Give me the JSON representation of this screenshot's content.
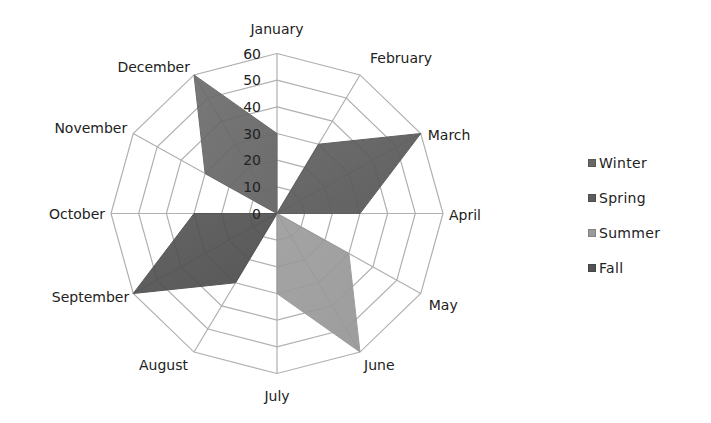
{
  "chart_data": {
    "type": "radar",
    "title": "",
    "categories": [
      "January",
      "February",
      "March",
      "April",
      "May",
      "June",
      "July",
      "August",
      "September",
      "October",
      "November",
      "December"
    ],
    "series": [
      {
        "name": "Winter",
        "color": "#686868",
        "values": [
          30,
          0,
          0,
          0,
          0,
          0,
          0,
          0,
          0,
          0,
          30,
          60
        ]
      },
      {
        "name": "Spring",
        "color": "#5c5c5c",
        "values": [
          0,
          30,
          60,
          30,
          0,
          0,
          0,
          0,
          0,
          0,
          0,
          0
        ]
      },
      {
        "name": "Summer",
        "color": "#9a9a9a",
        "values": [
          0,
          0,
          0,
          0,
          30,
          60,
          30,
          0,
          0,
          0,
          0,
          0
        ]
      },
      {
        "name": "Fall",
        "color": "#525252",
        "values": [
          0,
          0,
          0,
          0,
          0,
          0,
          0,
          30,
          60,
          30,
          0,
          0
        ]
      }
    ],
    "radial_axis": {
      "min": 0,
      "max": 60,
      "step": 10,
      "tick_labels": [
        "0",
        "10",
        "20",
        "30",
        "40",
        "50",
        "60"
      ]
    },
    "grid": true,
    "gridline_color": "#b0b0b0",
    "legend_position": "right"
  },
  "legend": {
    "items": [
      {
        "label": "Winter",
        "color": "#686868"
      },
      {
        "label": "Spring",
        "color": "#5c5c5c"
      },
      {
        "label": "Summer",
        "color": "#9a9a9a"
      },
      {
        "label": "Fall",
        "color": "#525252"
      }
    ]
  }
}
